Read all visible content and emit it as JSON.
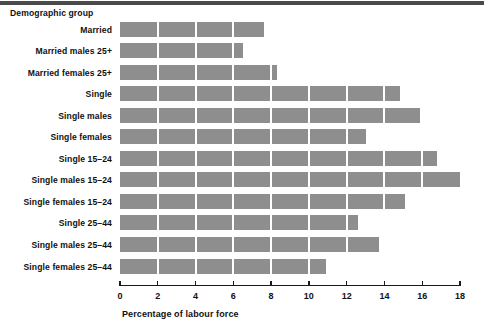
{
  "chart_data": {
    "type": "bar",
    "orientation": "horizontal",
    "title": "",
    "xlabel": "Percentage of labour force",
    "ylabel": "Demographic group",
    "xlim": [
      0,
      18
    ],
    "xticks": [
      0,
      2,
      4,
      6,
      8,
      10,
      12,
      14,
      16,
      18
    ],
    "grid": false,
    "legend": null,
    "bar_color": "#8e8e8e",
    "segment_divider_color": "#ffffff",
    "categories": [
      "Married",
      "Married males 25+",
      "Married females 25+",
      "Single",
      "Single males",
      "Single females",
      "Single 15–24",
      "Single males 15–24",
      "Single females 15–24",
      "Single 25–44",
      "Single males 25–44",
      "Single females 25–44"
    ],
    "values": [
      7.6,
      6.5,
      8.3,
      14.8,
      15.9,
      13.0,
      16.8,
      18.0,
      15.1,
      12.6,
      13.7,
      10.9
    ]
  },
  "axis": {
    "tick_labels": [
      "0",
      "2",
      "4",
      "6",
      "8",
      "10",
      "12",
      "14",
      "16",
      "18"
    ],
    "x_title": "Percentage of labour force",
    "y_title": "Demographic group"
  }
}
